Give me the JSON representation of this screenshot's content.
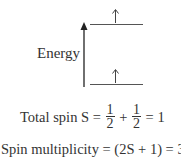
{
  "diagram": {
    "axis_label": "Energy",
    "levels": [
      {
        "name": "upper-level",
        "electron": "↑"
      },
      {
        "name": "lower-level",
        "electron": "↑"
      }
    ],
    "colors": {
      "ink": "#333333",
      "background": "#ffffff"
    }
  },
  "equations": {
    "total_spin": {
      "lhs": "Total spin S =",
      "frac1_num": "1",
      "frac1_den": "2",
      "plus": "+",
      "frac2_num": "1",
      "frac2_den": "2",
      "rhs": "= 1"
    },
    "multiplicity": "Spin multiplicity = (2S + 1) = 3"
  }
}
